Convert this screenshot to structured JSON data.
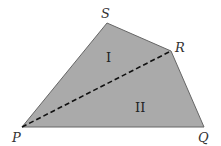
{
  "diagram": {
    "type": "quadrilateral",
    "fill_color": "#aaaaaa",
    "stroke_color": "#555555",
    "diagonal_style": "dashed",
    "vertices": {
      "P": {
        "label": "P",
        "x": 22,
        "y": 127
      },
      "Q": {
        "label": "Q",
        "x": 204,
        "y": 127
      },
      "R": {
        "label": "R",
        "x": 171,
        "y": 51
      },
      "S": {
        "label": "S",
        "x": 107,
        "y": 23
      }
    },
    "regions": [
      {
        "label": "I",
        "x": 110,
        "y": 62
      },
      {
        "label": "II",
        "x": 142,
        "y": 112
      }
    ],
    "diagonal": {
      "from": "P",
      "to": "R"
    }
  }
}
